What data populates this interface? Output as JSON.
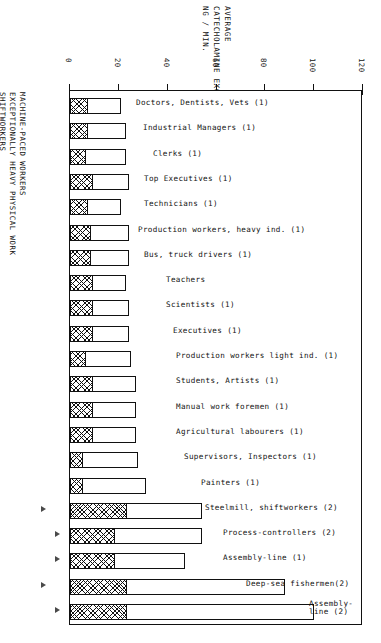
{
  "axis_title": {
    "line1": "AVERAGE",
    "line2": "CATECHOLAMINE EXCRETION",
    "line3": "NG / MIN."
  },
  "category_labels": [
    {
      "text": "MACHINE-PACED WORKERS"
    },
    {
      "text": "EXCEPTIONALLY HEAVY PHYSICAL WORK"
    },
    {
      "text": "SHIFTWORKERS"
    }
  ],
  "colors": {
    "ink": "#111111",
    "hatch": "#111111",
    "fill": "#ffffff",
    "marker": "#4a4a4a"
  },
  "chart_data": {
    "type": "bar",
    "orientation": "horizontal",
    "title": "AVERAGE CATECHOLAMINE EXCRETION NG / MIN.",
    "xlabel": "AVERAGE CATECHOLAMINE EXCRETION NG / MIN.",
    "ylabel": "",
    "xlim": [
      0,
      120
    ],
    "xticks": [
      0,
      10,
      20,
      30,
      40,
      50,
      60,
      70,
      80,
      90,
      100,
      110,
      120
    ],
    "xtick_labels": [
      "0",
      "20",
      "40",
      "60",
      "80",
      "100",
      "120"
    ],
    "labeled_ticks": [
      0,
      20,
      40,
      60,
      80,
      100,
      120
    ],
    "grid": false,
    "legend": [],
    "stacked": true,
    "series": [
      {
        "name": "baseline (hatched)",
        "values": [
          7,
          7,
          6,
          9,
          7,
          8,
          8,
          9,
          9,
          9,
          6,
          9,
          9,
          9,
          5,
          5,
          23,
          18,
          18,
          23,
          23
        ]
      },
      {
        "name": "extension (open)",
        "values": [
          14,
          16,
          17,
          15,
          14,
          16,
          16,
          14,
          15,
          15,
          19,
          18,
          18,
          18,
          23,
          26,
          31,
          36,
          29,
          65,
          77
        ]
      }
    ],
    "categories": [
      "Doctors, Dentists, Vets (1)",
      "Industrial Managers (1)",
      "Clerks (1)",
      "Top Executives (1)",
      "Technicians (1)",
      "Production workers, heavy ind. (1)",
      "Bus, truck drivers (1)",
      "Teachers",
      "Scientists (1)",
      "Executives (1)",
      "Production workers light ind. (1)",
      "Students, Artists (1)",
      "Manual work foremen (1)",
      "Agricultural labourers (1)",
      "Supervisors, Inspectors (1)",
      "Painters (1)",
      "Steelmill, shiftworkers (2)",
      "Process-controllers (2)",
      "Assembly-line (1)",
      "Deep-sea fishermen(2)",
      "Assembly-line (2)"
    ],
    "totals": [
      21,
      23,
      23,
      24,
      21,
      24,
      24,
      23,
      24,
      24,
      25,
      27,
      27,
      27,
      28,
      31,
      54,
      54,
      47,
      88,
      100
    ]
  },
  "bars": [
    {
      "label": "Doctors, Dentists, Vets (1)",
      "hatch": 7,
      "total": 21,
      "label_x": 135,
      "markers": []
    },
    {
      "label": "Industrial Managers (1)",
      "hatch": 7,
      "total": 23,
      "label_x": 142,
      "markers": []
    },
    {
      "label": "Clerks (1)",
      "hatch": 6,
      "total": 23,
      "label_x": 152,
      "markers": []
    },
    {
      "label": "Top Executives (1)",
      "hatch": 9,
      "total": 24,
      "label_x": 143,
      "markers": []
    },
    {
      "label": "Technicians (1)",
      "hatch": 7,
      "total": 21,
      "label_x": 143,
      "markers": []
    },
    {
      "label": "Production workers, heavy ind. (1)",
      "hatch": 8,
      "total": 24,
      "label_x": 137,
      "markers": []
    },
    {
      "label": "Bus, truck drivers (1)",
      "hatch": 8,
      "total": 24,
      "label_x": 143,
      "markers": []
    },
    {
      "label": "Teachers",
      "hatch": 9,
      "total": 23,
      "label_x": 165,
      "markers": []
    },
    {
      "label": "Scientists (1)",
      "hatch": 9,
      "total": 24,
      "label_x": 165,
      "markers": []
    },
    {
      "label": "Executives (1)",
      "hatch": 9,
      "total": 24,
      "label_x": 172,
      "markers": []
    },
    {
      "label": "Production workers light ind. (1)",
      "hatch": 6,
      "total": 25,
      "label_x": 175,
      "markers": []
    },
    {
      "label": "Students, Artists (1)",
      "hatch": 9,
      "total": 27,
      "label_x": 175,
      "markers": []
    },
    {
      "label": "Manual work foremen (1)",
      "hatch": 9,
      "total": 27,
      "label_x": 175,
      "markers": []
    },
    {
      "label": "Agricultural labourers (1)",
      "hatch": 9,
      "total": 27,
      "label_x": 175,
      "markers": []
    },
    {
      "label": "Supervisors, Inspectors (1)",
      "hatch": 5,
      "total": 28,
      "label_x": 183,
      "markers": []
    },
    {
      "label": "Painters (1)",
      "hatch": 5,
      "total": 31,
      "label_x": 200,
      "markers": []
    },
    {
      "label": "Steelmill, shiftworkers (2)",
      "hatch": 23,
      "total": 54,
      "label_x": 204,
      "markers": [
        1
      ]
    },
    {
      "label": "Process-controllers (2)",
      "hatch": 18,
      "total": 54,
      "label_x": 222,
      "markers": [
        2
      ]
    },
    {
      "label": "Assembly-line (1)",
      "hatch": 18,
      "total": 47,
      "label_x": 222,
      "markers": [
        2
      ]
    },
    {
      "label": "Deep-sea fishermen(2)",
      "hatch": 23,
      "total": 88,
      "label_x": 245,
      "markers": [
        1
      ]
    },
    {
      "label": "Assembly-line (2)",
      "hatch": 23,
      "total": 100,
      "label_x": 308,
      "markers": [
        2
      ],
      "two_line": "Assembly-\nline (2)"
    }
  ]
}
